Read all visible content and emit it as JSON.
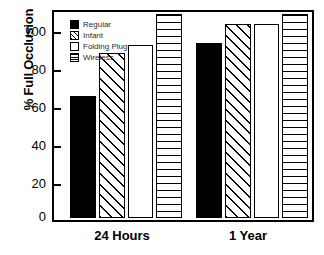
{
  "chart_data": {
    "type": "bar",
    "title": "",
    "subtitle": "",
    "xlabel": "",
    "ylabel": "% Full Occlusion",
    "categories": [
      "24 Hours",
      "1 Year"
    ],
    "series": [
      {
        "name": "Regular",
        "values": [
          60,
          86
        ],
        "fill": "solid"
      },
      {
        "name": "Infant",
        "values": [
          81,
          95
        ],
        "fill": "hatch"
      },
      {
        "name": "Folding Plug",
        "values": [
          85,
          95
        ],
        "fill": "plain"
      },
      {
        "name": "Wireless",
        "values": [
          100,
          100
        ],
        "fill": "hlines"
      }
    ],
    "ylim": [
      0,
      100
    ],
    "yticks": [
      0,
      20,
      40,
      60,
      80,
      100
    ],
    "ytick_labels": [
      "0",
      "20",
      "40",
      "60",
      "80",
      "100"
    ],
    "grid": false,
    "legend_position": "top-left",
    "colors": {
      "foreground": "#000000",
      "background": "#ffffff",
      "legend_text": "#2b2b2b"
    }
  },
  "legend": {
    "entries": [
      {
        "label": "Regular"
      },
      {
        "label": "Infant"
      },
      {
        "label": "Folding Plug"
      },
      {
        "label": "Wireless"
      }
    ]
  },
  "axes": {
    "y_title": "% Full Occlusion",
    "y_ticks": [
      "100",
      "80",
      "60",
      "40",
      "20",
      "0"
    ],
    "x_categories": [
      "24 Hours",
      "1 Year"
    ]
  }
}
